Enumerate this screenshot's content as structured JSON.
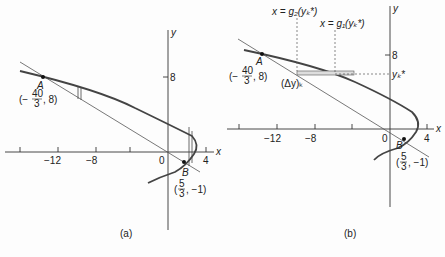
{
  "figure": {
    "panels": [
      {
        "id": "a",
        "caption": "(a)",
        "axes": {
          "x_label": "x",
          "y_label": "y",
          "x_ticks": [
            "−12",
            "−8",
            "0",
            "4"
          ],
          "y_ticks": [
            "8"
          ]
        },
        "points": {
          "A": {
            "name": "A",
            "coord_prefix": "(−",
            "coord_num": "40",
            "coord_den": "3",
            "coord_suffix": ", 8)"
          },
          "B": {
            "name": "B",
            "coord_prefix": "(",
            "coord_num": "5",
            "coord_den": "3",
            "coord_suffix": ", −1)"
          }
        }
      },
      {
        "id": "b",
        "caption": "(b)",
        "axes": {
          "x_label": "x",
          "y_label": "y",
          "x_ticks": [
            "−12",
            "−8",
            "0",
            "4"
          ],
          "y_ticks": [
            "8"
          ]
        },
        "points": {
          "A": {
            "name": "A",
            "coord_prefix": "(−",
            "coord_num": "40",
            "coord_den": "3",
            "coord_suffix": ", 8)"
          },
          "B": {
            "name": "B",
            "coord_prefix": "(",
            "coord_num": "5",
            "coord_den": "3",
            "coord_suffix": ", −1)"
          }
        },
        "annotations": {
          "g2": "x = g₂(yₖ*)",
          "g1": "x = g₁(yₖ*)",
          "yk": "yₖ*",
          "dy": "(Δy)ₖ"
        }
      }
    ],
    "curves": {
      "parabola": "x = 3 − (y − 1)²/3",
      "line": "x = −5y/3"
    }
  }
}
